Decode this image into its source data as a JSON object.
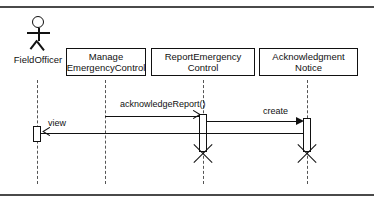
{
  "diagram": {
    "type": "uml-sequence-diagram",
    "frame": {
      "top_rule": true,
      "bottom_rule": true,
      "rule_color": "#4a4a4a"
    },
    "actor": {
      "name": "actor-field-officer",
      "label": "FieldOfficer",
      "icon": "stick-figure-actor-icon"
    },
    "participants": [
      {
        "id": "manage-emergency-control",
        "label": "Manage\nEmergencyControl",
        "line1": "Manage",
        "line2": "EmergencyControl"
      },
      {
        "id": "report-emergency-control",
        "label": "ReportEmergency\nControl",
        "line1": "ReportEmergency",
        "line2": "Control"
      },
      {
        "id": "acknowledgment-notice",
        "label": "Acknowledgment\nNotice",
        "line1": "Acknowledgment",
        "line2": "Notice"
      }
    ],
    "messages": [
      {
        "id": "acknowledge-report",
        "label": "acknowledgeReport()",
        "from": "manage-emergency-control",
        "to": "report-emergency-control",
        "arrow": "open-arrow-right",
        "kind": "synchronous-call"
      },
      {
        "id": "create",
        "label": "create",
        "from": "report-emergency-control",
        "to": "acknowledgment-notice",
        "arrow": "filled-arrow-right",
        "kind": "create-message"
      },
      {
        "id": "view",
        "label": "view",
        "from": "acknowledgment-notice",
        "to": "actor-field-officer",
        "arrow": "open-arrow-left",
        "kind": "return-message"
      }
    ],
    "destructions": [
      {
        "id": "destroy-report-emergency-control",
        "target": "report-emergency-control",
        "marker": "destruction-x-icon"
      },
      {
        "id": "destroy-acknowledgment-notice",
        "target": "acknowledgment-notice",
        "marker": "destruction-x-icon"
      }
    ],
    "colors": {
      "stroke": "#111111",
      "lifeline": "#555555",
      "frame_rule": "#4a4a4a",
      "background": "#ffffff"
    }
  }
}
